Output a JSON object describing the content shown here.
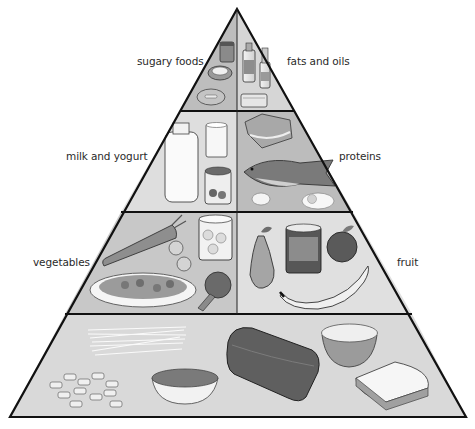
{
  "diagram": {
    "type": "food-pyramid",
    "tiers": [
      {
        "level": 1,
        "sections": [
          {
            "label": "sugary foods",
            "side": "left",
            "items": [
              "jar of sweets",
              "jam tart",
              "doughnut"
            ]
          },
          {
            "label": "fats and oils",
            "side": "right",
            "items": [
              "oil bottle",
              "small oil bottle",
              "butter"
            ]
          }
        ]
      },
      {
        "level": 2,
        "sections": [
          {
            "label": "milk and yogurt",
            "side": "left",
            "items": [
              "milk bottle",
              "glass of milk",
              "yogurt pot"
            ]
          },
          {
            "label": "proteins",
            "side": "right",
            "items": [
              "meat",
              "fish",
              "eggs"
            ]
          }
        ]
      },
      {
        "level": 3,
        "sections": [
          {
            "label": "vegetables",
            "side": "left",
            "items": [
              "carrot",
              "sprouts",
              "canned mushrooms",
              "salad plate",
              "broccoli"
            ]
          },
          {
            "label": "fruit",
            "side": "right",
            "items": [
              "pear",
              "canned fruit",
              "apple",
              "banana"
            ]
          }
        ]
      },
      {
        "level": 4,
        "sections": [
          {
            "label": "",
            "side": "full",
            "items": [
              "spaghetti",
              "pasta tubes",
              "bowl of cereal",
              "loaf of bread",
              "bowl of rice",
              "bread slices"
            ]
          }
        ]
      }
    ]
  },
  "labels": {
    "sugary": "sugary foods",
    "fats": "fats and oils",
    "milk": "milk and yogurt",
    "proteins": "proteins",
    "vegetables": "vegetables",
    "fruit": "fruit"
  },
  "colors": {
    "outline": "#111111",
    "sugary_bg": "#bdbdbd",
    "fats_bg": "#d6d6d6",
    "milk_bg": "#dedede",
    "proteins_bg": "#bcbcbc",
    "vegetables_bg": "#c8c8c8",
    "fruit_bg": "#e0e0e0",
    "grains_bg": "#d9d9d9"
  }
}
